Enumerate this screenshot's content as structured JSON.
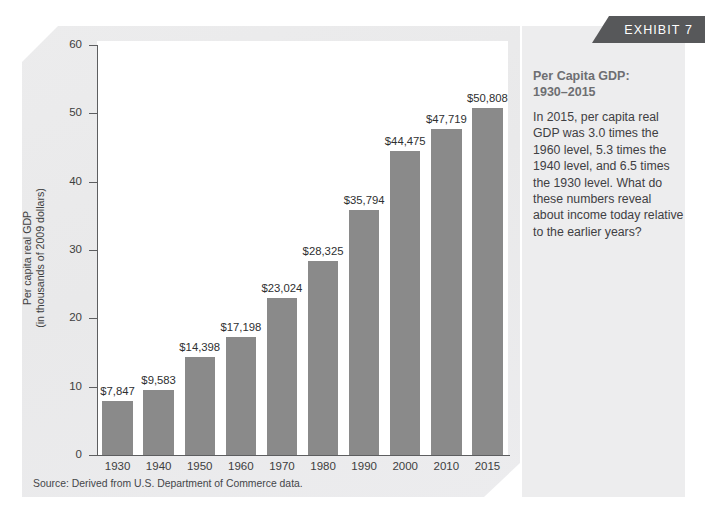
{
  "banner": {
    "label": "EXHIBIT 7"
  },
  "caption": {
    "heading": "Per Capita GDP:\n1930–2015",
    "body": "In 2015, per capita real GDP was 3.0 times the 1960 level, 5.3 times the 1940 level, and 6.5 times the 1930 level. What do these numbers reveal about income today relative to the earlier years?"
  },
  "source": {
    "text": "Source: Derived from U.S. Department of Commerce data."
  },
  "colors": {
    "bar": "#8a8a8a",
    "banner": "#57585a",
    "panel": "#ededee",
    "plot_background": "#ffffff",
    "axis": "#5d5e60",
    "heading_text": "#6e6f72",
    "body_text": "#3f4043"
  },
  "chart_data": {
    "type": "bar",
    "title": "Per Capita GDP: 1930–2015",
    "xlabel": "",
    "ylabel": "Per capita real GDP\n(in thousands of 2009 dollars)",
    "categories": [
      "1930",
      "1940",
      "1950",
      "1960",
      "1970",
      "1980",
      "1990",
      "2000",
      "2010",
      "2015"
    ],
    "values": [
      7.847,
      9.583,
      14.398,
      17.198,
      23.024,
      28.325,
      35.794,
      44.475,
      47.719,
      50.808
    ],
    "value_labels": [
      "$7,847",
      "$9,583",
      "$14,398",
      "$17,198",
      "$23,024",
      "$28,325",
      "$35,794",
      "$44,475",
      "$47,719",
      "$50,808"
    ],
    "ylim": [
      0,
      60
    ],
    "yticks": [
      0,
      10,
      20,
      30,
      40,
      50,
      60
    ],
    "ytick_labels": [
      "0",
      "10",
      "20",
      "30",
      "40",
      "50",
      "60"
    ],
    "grid": false,
    "legend": false,
    "units": "thousands of 2009 dollars"
  }
}
